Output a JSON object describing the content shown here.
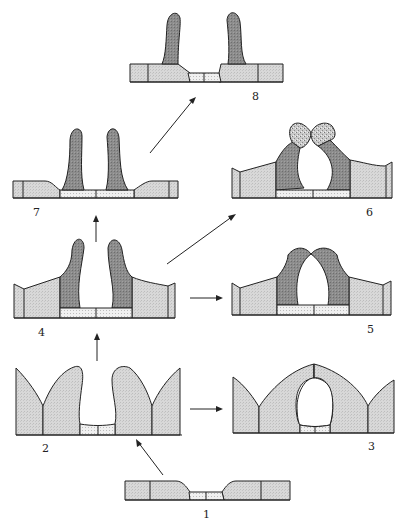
{
  "diagram": {
    "type": "developmental-stage-sequence",
    "stages": [
      {
        "id": "1",
        "label": "1"
      },
      {
        "id": "2",
        "label": "2"
      },
      {
        "id": "3",
        "label": "3"
      },
      {
        "id": "4",
        "label": "4"
      },
      {
        "id": "5",
        "label": "5"
      },
      {
        "id": "6",
        "label": "6"
      },
      {
        "id": "7",
        "label": "7"
      },
      {
        "id": "8",
        "label": "8"
      }
    ],
    "transitions": [
      {
        "from": "1",
        "to": "2"
      },
      {
        "from": "2",
        "to": "3"
      },
      {
        "from": "2",
        "to": "4"
      },
      {
        "from": "4",
        "to": "5"
      },
      {
        "from": "4",
        "to": "6"
      },
      {
        "from": "4",
        "to": "7"
      },
      {
        "from": "7",
        "to": "8"
      }
    ],
    "colors": {
      "light_tissue": "#d6d6d6",
      "dark_tissue": "#8a8a8a",
      "stippled": "#ececec",
      "mottled": "#b5b5b5",
      "outline": "#222222"
    }
  }
}
